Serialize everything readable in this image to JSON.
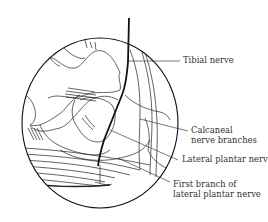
{
  "figure": {
    "colors": {
      "line": "#1a1a1a",
      "text": "#333333",
      "background": "#ffffff"
    },
    "labels": [
      {
        "id": "tibial",
        "text": "Tibial nerve",
        "lines": [
          "Tibial nerve"
        ]
      },
      {
        "id": "calcaneal",
        "text": "Calcaneal nerve branches",
        "lines": [
          "Calcaneal",
          "nerve branches"
        ]
      },
      {
        "id": "lateral-plantar",
        "text": "Lateral plantar nerve",
        "lines": [
          "Lateral plantar nerve"
        ]
      },
      {
        "id": "first-branch",
        "text": "First branch of lateral plantar nerve",
        "lines": [
          "First branch of",
          "lateral plantar nerve"
        ]
      }
    ]
  }
}
